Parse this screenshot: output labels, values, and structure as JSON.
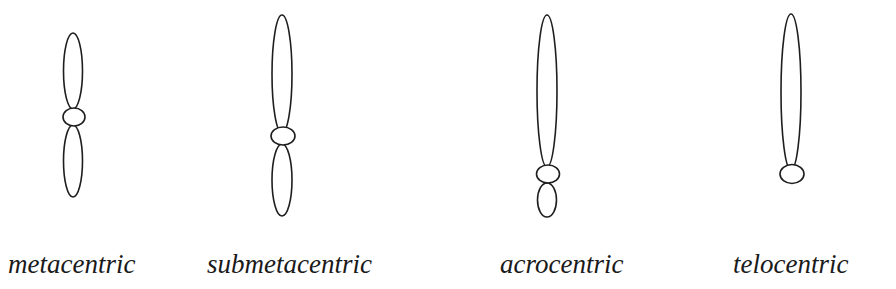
{
  "figure": {
    "type": "chromosome-classification-diagram",
    "stroke_color": "#1e1e1e",
    "background": "#ffffff"
  },
  "chromosomes": [
    {
      "label": "metacentric",
      "label_x": 8,
      "upper_arm": {
        "cx": 73,
        "cy": 71,
        "rx": 9.5,
        "ry": 38
      },
      "centromere": {
        "cx": 74,
        "cy": 117,
        "rx": 11,
        "ry": 9
      },
      "lower_arm": {
        "cx": 73,
        "cy": 161,
        "rx": 9.5,
        "ry": 36
      }
    },
    {
      "label": "submetacentric",
      "label_x": 207,
      "upper_arm": {
        "cx": 282,
        "cy": 74,
        "rx": 10,
        "ry": 59
      },
      "centromere": {
        "cx": 283,
        "cy": 136,
        "rx": 12,
        "ry": 9
      },
      "lower_arm": {
        "cx": 282,
        "cy": 180,
        "rx": 10,
        "ry": 36
      }
    },
    {
      "label": "acrocentric",
      "label_x": 500,
      "upper_arm": {
        "cx": 547,
        "cy": 91,
        "rx": 10,
        "ry": 76
      },
      "centromere": {
        "cx": 548,
        "cy": 174,
        "rx": 11.5,
        "ry": 9
      },
      "lower_arm": {
        "cx": 547,
        "cy": 200,
        "rx": 9.5,
        "ry": 17
      }
    },
    {
      "label": "telocentric",
      "label_x": 733,
      "upper_arm": {
        "cx": 791,
        "cy": 92,
        "rx": 10,
        "ry": 78
      },
      "centromere": {
        "cx": 792,
        "cy": 174,
        "rx": 12,
        "ry": 9.5
      },
      "lower_arm": null
    }
  ]
}
